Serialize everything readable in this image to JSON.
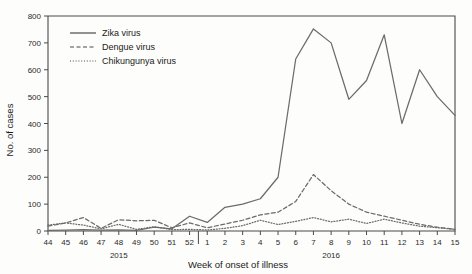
{
  "chart_data": {
    "type": "line",
    "title": "",
    "xlabel": "Week of onset of illness",
    "ylabel": "No. of cases",
    "ylim": [
      0,
      800
    ],
    "ytick_labels": [
      "0",
      "100",
      "200",
      "300",
      "400",
      "500",
      "600",
      "700",
      "800"
    ],
    "yticks": [
      0,
      100,
      200,
      300,
      400,
      500,
      600,
      700,
      800
    ],
    "grid": false,
    "legend_position": "upper-left-inside",
    "categories": [
      "44",
      "45",
      "46",
      "47",
      "48",
      "49",
      "50",
      "51",
      "52",
      "1",
      "2",
      "3",
      "4",
      "5",
      "6",
      "7",
      "8",
      "9",
      "10",
      "11",
      "12",
      "13",
      "14",
      "15"
    ],
    "x_group_labels": [
      {
        "label": "2015",
        "from": "44",
        "to": "52"
      },
      {
        "label": "2016",
        "from": "1",
        "to": "15"
      }
    ],
    "year_divider_after": "52",
    "series": [
      {
        "name": "Zika virus",
        "style": "solid",
        "values": [
          2,
          3,
          5,
          3,
          4,
          2,
          14,
          8,
          55,
          32,
          88,
          100,
          120,
          200,
          640,
          752,
          700,
          490,
          560,
          730,
          400,
          600,
          500,
          430
        ]
      },
      {
        "name": "Dengue virus",
        "style": "dashed",
        "values": [
          18,
          30,
          50,
          10,
          42,
          38,
          40,
          12,
          30,
          12,
          26,
          40,
          60,
          70,
          110,
          210,
          150,
          100,
          70,
          55,
          40,
          25,
          14,
          6
        ]
      },
      {
        "name": "Chikungunya virus",
        "style": "dotted",
        "values": [
          22,
          30,
          22,
          8,
          25,
          6,
          16,
          5,
          6,
          4,
          10,
          20,
          40,
          24,
          36,
          50,
          34,
          44,
          28,
          44,
          30,
          18,
          12,
          6
        ]
      }
    ]
  },
  "legend": {
    "items": [
      {
        "label": "Zika virus",
        "style": "solid"
      },
      {
        "label": "Dengue virus",
        "style": "dashed"
      },
      {
        "label": "Chikungunya virus",
        "style": "dotted"
      }
    ]
  }
}
